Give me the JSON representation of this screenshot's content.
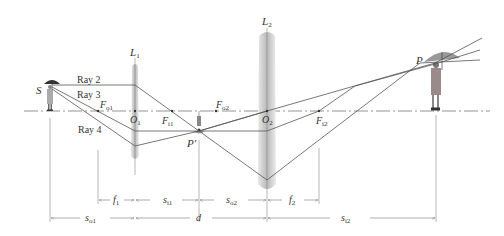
{
  "figure": {
    "type": "two-lens optical system ray diagram",
    "lenses": [
      {
        "id": "L1",
        "label": "L",
        "sub": "1",
        "center_label": "O",
        "center_sub": "1"
      },
      {
        "id": "L2",
        "label": "L",
        "sub": "2",
        "center_label": "O",
        "center_sub": "2"
      }
    ],
    "object_label": "S",
    "intermediate_image_label": "P′",
    "final_image_label": "P",
    "rays": [
      {
        "label": "Ray 2"
      },
      {
        "label": "Ray 3"
      },
      {
        "label": "Ray 4"
      }
    ],
    "focal_points": [
      {
        "main": "F",
        "sub": "o1"
      },
      {
        "main": "F",
        "sub": "i1"
      },
      {
        "main": "F",
        "sub": "o2"
      },
      {
        "main": "F",
        "sub": "i2"
      }
    ],
    "dimensions_row1": [
      {
        "main": "f",
        "sub": "1"
      },
      {
        "main": "s",
        "sub": "i1"
      },
      {
        "main": "s",
        "sub": "o2"
      },
      {
        "main": "f",
        "sub": "2"
      }
    ],
    "dimensions_row2": [
      {
        "main": "s",
        "sub": "o1"
      },
      {
        "main": "d",
        "sub": ""
      },
      {
        "main": "s",
        "sub": "i2"
      }
    ]
  },
  "colors": {
    "lens_fill": "#d9d9d9",
    "line": "#555555",
    "text": "#333333"
  }
}
